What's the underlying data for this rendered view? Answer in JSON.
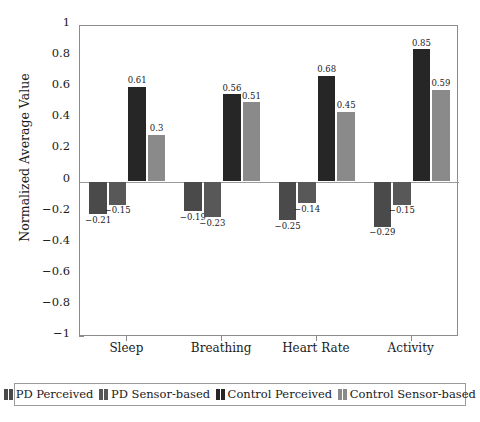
{
  "chart_data": {
    "type": "bar",
    "title": "",
    "xlabel": "",
    "ylabel": "Normalized Average Value",
    "ylim": [
      -1,
      1
    ],
    "ytick_values": [
      1,
      0.8,
      0.6,
      0.4,
      0.2,
      0,
      -0.2,
      -0.4,
      -0.6,
      -0.8,
      -1
    ],
    "ytick_labels": [
      "1",
      "0.8",
      "0.6",
      "0.4",
      "0.2",
      "0",
      "−0.2",
      "−0.4",
      "−0.6",
      "−0.8",
      "−1"
    ],
    "grid": false,
    "legend_position": "bottom",
    "categories": [
      "Sleep",
      "Breathing",
      "Heart Rate",
      "Activity"
    ],
    "series": [
      {
        "name": "PD Perceived",
        "color": "#4a4a4a",
        "values": [
          -0.21,
          -0.19,
          -0.25,
          -0.29
        ],
        "labels": [
          "−0.21",
          "−0.19",
          "−0.25",
          "−0.29"
        ]
      },
      {
        "name": "PD Sensor-based",
        "color": "#585858",
        "values": [
          -0.15,
          -0.23,
          -0.14,
          -0.15
        ],
        "labels": [
          "−0.15",
          "−0.23",
          "−0.14",
          "−0.15"
        ]
      },
      {
        "name": "Control Perceived",
        "color": "#262626",
        "values": [
          0.61,
          0.56,
          0.68,
          0.85
        ],
        "labels": [
          "0.61",
          "0.56",
          "0.68",
          "0.85"
        ]
      },
      {
        "name": "Control Sensor-based",
        "color": "#8a8a8a",
        "values": [
          0.3,
          0.51,
          0.45,
          0.59
        ],
        "labels": [
          "0.3",
          "0.51",
          "0.45",
          "0.59"
        ]
      }
    ]
  },
  "legend": {
    "items": [
      {
        "label": "PD Perceived",
        "color": "#4a4a4a"
      },
      {
        "label": "PD Sensor-based",
        "color": "#585858"
      },
      {
        "label": "Control Perceived",
        "color": "#262626"
      },
      {
        "label": "Control Sensor-based",
        "color": "#8a8a8a"
      }
    ]
  }
}
